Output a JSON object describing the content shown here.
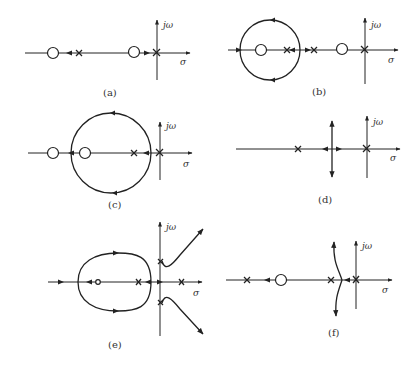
{
  "figure": {
    "panels": [
      {
        "id": "a",
        "caption": "(a)",
        "jw_label": "jω",
        "sigma_label": "σ"
      },
      {
        "id": "b",
        "caption": "(b)",
        "jw_label": "jω",
        "sigma_label": "σ"
      },
      {
        "id": "c",
        "caption": "(c)",
        "jw_label": "jω",
        "sigma_label": "σ"
      },
      {
        "id": "d",
        "caption": "(d)",
        "jw_label": "jω",
        "sigma_label": "σ"
      },
      {
        "id": "e",
        "caption": "(e)",
        "jw_label": "jω",
        "sigma_label": "σ"
      },
      {
        "id": "f",
        "caption": "(f)",
        "jw_label": "jω",
        "sigma_label": "σ"
      }
    ]
  },
  "colors": {
    "stroke": "#222222",
    "background": "#ffffff"
  }
}
